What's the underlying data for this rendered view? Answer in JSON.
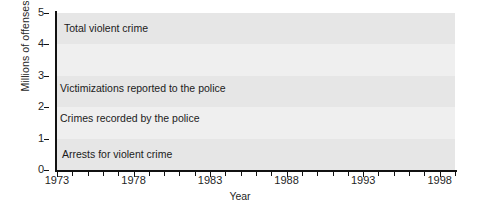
{
  "chart_data": {
    "type": "line",
    "title": "",
    "xlabel": "Year",
    "ylabel": "Millions of offenses",
    "xlim": [
      1973,
      1999
    ],
    "ylim": [
      0,
      5
    ],
    "ytick_labels": [
      "5",
      "4",
      "3",
      "2",
      "1",
      "0"
    ],
    "ytick_values": [
      5,
      4,
      3,
      2,
      1,
      0
    ],
    "xtick_labels": [
      "1973",
      "1978",
      "1983",
      "1988",
      "1993",
      "1998"
    ],
    "xtick_values": [
      1973,
      1978,
      1983,
      1988,
      1993,
      1998
    ],
    "minor_ticks": "every year",
    "grid": false,
    "background_bands": true,
    "legend_position": "inline-labels",
    "x": [
      1973,
      1974,
      1975,
      1976,
      1977,
      1978,
      1979,
      1980,
      1981,
      1982,
      1983,
      1984,
      1985,
      1986,
      1987,
      1988,
      1989,
      1990,
      1991,
      1992,
      1993,
      1994,
      1995,
      1996,
      1997,
      1998,
      1999
    ],
    "series": [
      {
        "name": "Total violent crime",
        "label": "Total violent crime",
        "color": "#111111",
        "style": "solid",
        "width": 2.6,
        "values": [
          3.65,
          3.8,
          3.72,
          3.62,
          3.62,
          3.63,
          3.62,
          3.63,
          3.64,
          3.63,
          3.62,
          3.65,
          3.7,
          3.78,
          3.75,
          3.8,
          3.85,
          3.92,
          4.05,
          4.15,
          4.08,
          4.05,
          3.5,
          3.62,
          3.6,
          3.1,
          2.42
        ]
      },
      {
        "name": "Victimizations reported to the police",
        "label": "Victimizations reported to the police",
        "color": "#9a9a9a",
        "style": "solid",
        "width": 1.8,
        "values": [
          1.88,
          2.0,
          1.98,
          1.95,
          1.96,
          1.92,
          1.95,
          1.92,
          2.0,
          1.95,
          1.78,
          1.82,
          1.8,
          1.85,
          1.88,
          1.92,
          1.9,
          1.95,
          2.0,
          2.12,
          2.2,
          2.18,
          2.05,
          1.95,
          1.85,
          1.7,
          1.25
        ]
      },
      {
        "name": "Crimes recorded by the police",
        "label": "Crimes recorded by the police",
        "color": "#111111",
        "style": "dashed",
        "width": 2.6,
        "values": [
          0.79,
          0.8,
          0.82,
          0.8,
          0.8,
          0.83,
          0.9,
          0.97,
          0.99,
          0.99,
          0.96,
          0.95,
          0.98,
          1.12,
          1.18,
          1.25,
          1.35,
          1.45,
          1.52,
          1.55,
          1.55,
          1.5,
          1.45,
          1.38,
          1.32,
          1.22,
          1.05
        ]
      },
      {
        "name": "Arrests for violent crime",
        "label": "Arrests for violent crime",
        "color": "#a0a0a0",
        "style": "dotted",
        "width": 2.2,
        "values": [
          0.42,
          0.42,
          0.43,
          0.42,
          0.42,
          0.44,
          0.46,
          0.47,
          0.48,
          0.48,
          0.47,
          0.48,
          0.5,
          0.54,
          0.58,
          0.6,
          0.62,
          0.66,
          0.7,
          0.72,
          0.73,
          0.73,
          0.72,
          0.7,
          0.68,
          0.64,
          0.58
        ]
      }
    ]
  }
}
